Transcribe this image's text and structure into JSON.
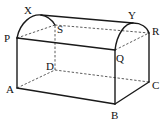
{
  "figure": {
    "type": "3d-solid",
    "vertices": {
      "P": "P",
      "Q": "Q",
      "R": "R",
      "S": "S",
      "A": "A",
      "B": "B",
      "C": "C",
      "D": "D",
      "X": "X",
      "Y": "Y"
    },
    "visible_edges": [
      "PA",
      "AB",
      "BC",
      "QB",
      "RC",
      "PQ",
      "XY",
      "arc P-X-S",
      "arc Q-Y-R"
    ],
    "hidden_edges": [
      "AD",
      "DC",
      "DS",
      "PS",
      "QR"
    ]
  }
}
